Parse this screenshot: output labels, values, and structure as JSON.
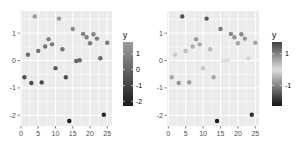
{
  "chart_data": [
    {
      "type": "scatter",
      "panel": "left",
      "title": "",
      "xlabel": "",
      "ylabel": "",
      "xlim": [
        -0.5,
        26
      ],
      "ylim": [
        -2.4,
        1.8
      ],
      "x_ticks": [
        0,
        5,
        10,
        15,
        20,
        25
      ],
      "y_ticks": [
        -2,
        -1,
        0,
        1
      ],
      "grid": true,
      "color_scale": "sequential gray (dark = low, light = high)",
      "legend": {
        "title": "y",
        "position": "right",
        "labels": [
          "1",
          "0",
          "-1",
          "-2"
        ],
        "values": [
          1,
          0,
          -1,
          -2
        ]
      },
      "x": [
        1,
        2,
        3,
        4,
        5,
        6,
        7,
        8,
        9,
        10,
        11,
        12,
        13,
        14,
        15,
        16,
        17,
        18,
        19,
        20,
        21,
        22,
        23,
        24,
        25
      ],
      "y": [
        -0.61,
        0.21,
        -0.82,
        1.61,
        0.35,
        -0.8,
        0.51,
        0.78,
        0.59,
        -0.28,
        1.53,
        0.41,
        -0.61,
        -2.21,
        1.15,
        -0.02,
        0.01,
        0.97,
        0.85,
        0.63,
        0.96,
        0.8,
        0.08,
        -1.98,
        0.65
      ]
    },
    {
      "type": "scatter",
      "panel": "right",
      "title": "",
      "xlabel": "",
      "ylabel": "",
      "xlim": [
        -0.5,
        26
      ],
      "ylim": [
        -2.4,
        1.8
      ],
      "x_ticks": [
        0,
        5,
        10,
        15,
        20,
        25
      ],
      "y_ticks": [
        -2,
        -1,
        0,
        1
      ],
      "grid": true,
      "color_scale": "diverging gray (dark = extremes, light = near zero)",
      "legend": {
        "title": "y",
        "position": "right",
        "labels": [
          "1",
          "-1"
        ],
        "values": [
          1,
          -1
        ]
      },
      "x": [
        1,
        2,
        3,
        4,
        5,
        6,
        7,
        8,
        9,
        10,
        11,
        12,
        13,
        14,
        15,
        16,
        17,
        18,
        19,
        20,
        21,
        22,
        23,
        24,
        25
      ],
      "y": [
        -0.61,
        0.21,
        -0.82,
        1.61,
        0.35,
        -0.8,
        0.51,
        0.78,
        0.59,
        -0.28,
        1.53,
        0.41,
        -0.61,
        -2.21,
        1.15,
        -0.02,
        0.01,
        0.97,
        0.85,
        0.63,
        0.96,
        0.8,
        0.08,
        -1.98,
        0.65
      ]
    }
  ],
  "style": {
    "panel_bg": "#EBEBEB",
    "grid_color": "#FFFFFF",
    "tick_color": "#333333",
    "dark": "#1a1a1a",
    "light": "#d8d8d8"
  }
}
